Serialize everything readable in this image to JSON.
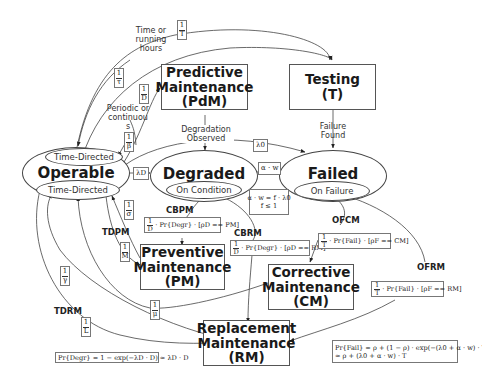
{
  "states": {
    "operable": {
      "title": "Operable",
      "top_sub": "Time-Directed",
      "bottom_sub": "Time-Directed"
    },
    "degraded": {
      "title": "Degraded",
      "sub": "On Condition"
    },
    "failed": {
      "title": "Failed",
      "sub": "On Failure"
    }
  },
  "boxes": {
    "pdm": "Predictive\nMaintenance\n(PdM)",
    "testing": "Testing\n(T)",
    "pm": "Preventive\nMaintenance\n(PM)",
    "cm": "Corrective\nMaintenance\n(CM)",
    "rm": "Replacement\nMaintenance\n(RM)"
  },
  "labels": {
    "time_running": "Time or\nrunning\nhours",
    "periodic": "Periodic or\ncontinuou\ns",
    "degradation_observed": "Degradation\nObserved",
    "failure_found": "Failure\nFound"
  },
  "tags": {
    "cbpm": "CBPM",
    "tdpm": "TDPM",
    "cbrm": "CBRM",
    "ofcm": "OFCM",
    "ofrm": "OFRM",
    "tdrm": "TDRM"
  },
  "rates": {
    "one_over_T": {
      "num": "1",
      "den": "T"
    },
    "one_over_tau": {
      "num": "1",
      "den": "τ"
    },
    "one_over_D": {
      "num": "1",
      "den": "D"
    },
    "one_over_beta": {
      "num": "1",
      "den": "β"
    },
    "one_over_sigma": {
      "num": "1",
      "den": "σ"
    },
    "one_over_M": {
      "num": "1",
      "den": "M"
    },
    "one_over_gamma": {
      "num": "1",
      "den": "γ"
    },
    "one_over_mu": {
      "num": "1",
      "den": "μ"
    },
    "one_over_L": {
      "num": "1",
      "den": "L"
    },
    "lambda_D": "λD",
    "lambda_0": "λ0",
    "alpha_w": "α · w"
  },
  "formulas": {
    "alpha_w_def_line1": "α · w = f · λ0",
    "alpha_w_def_line2": "f ≤ 1",
    "cbpm": {
      "num": "1",
      "den": "D",
      "expr": "· Pr{Degr} · [ρD == PM]"
    },
    "cbrm": {
      "num": "1",
      "den": "D",
      "expr": "· Pr{Degr} · [ρD == RM]"
    },
    "ofcm": {
      "num": "1",
      "den": "T",
      "expr": "· Pr{Fail} · [ρF == CM]"
    },
    "ofrm": {
      "num": "1",
      "den": "T",
      "expr": "· Pr{Fail} · [ρF == RM]"
    },
    "pr_degr": "Pr{Degr} = 1 − exp(−λD · D) ≈ λD · D",
    "pr_fail_line1": "Pr{Fail} = ρ + (1 − ρ) · exp(−(λ0 + α · w) · T) ≈",
    "pr_fail_line2": "≈ ρ + (λ0 + α · w) · T"
  }
}
